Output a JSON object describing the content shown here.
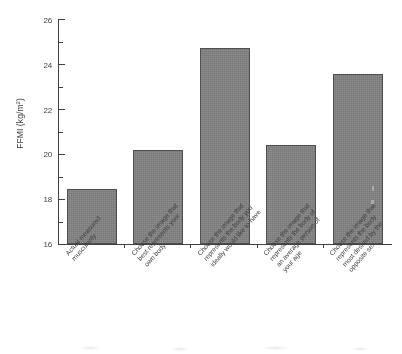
{
  "chart_data": {
    "type": "bar",
    "title": "",
    "subtitle": "",
    "xlabel": "",
    "ylabel": "FFMI (kg/m²)",
    "ylabel_base": "FFMI (kg/m",
    "ylabel_exponent": "2",
    "ylabel_suffix": ")",
    "ylim": [
      16,
      26
    ],
    "ytick_values": [
      16,
      18,
      20,
      22,
      24,
      26
    ],
    "ytick_labels": [
      "16",
      "18",
      "20",
      "22",
      "24",
      "26"
    ],
    "yminor_tick_values": [
      17,
      19,
      21,
      23,
      25
    ],
    "grid": false,
    "legend": false,
    "legend_position": "none",
    "bar_color": "#7c7c7c",
    "bar_edge_color": "#4a4a4a",
    "axis_color": "#3a3a3a",
    "categories": [
      "Actual measured muscularity",
      "Choose the image that best represents your own body",
      "Choose the image that represents the body you ideally would like to have",
      "Choose the image that represents the body of an average person of your age",
      "Choose the image that represents the body most desired by the opposite sex"
    ],
    "category_lines": [
      [
        "Actual measured",
        "muscularity"
      ],
      [
        "Choose the image that",
        "best represents your",
        "own body"
      ],
      [
        "Choose the image that",
        "represents the body you",
        "ideally would like to have"
      ],
      [
        "Choose the image that",
        "represents the body of",
        "an average person of",
        "your age"
      ],
      [
        "Choose the image that",
        "represents the body",
        "most desired by the",
        "opposite sex"
      ]
    ],
    "values": [
      18.45,
      20.2,
      24.75,
      20.4,
      23.6
    ]
  }
}
